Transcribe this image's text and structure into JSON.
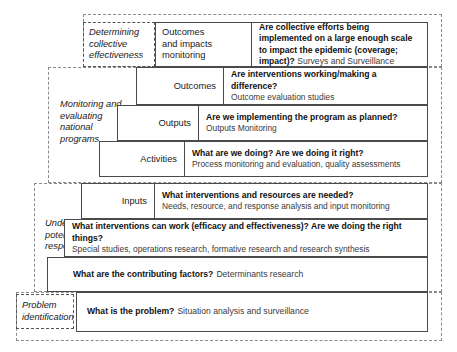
{
  "diagram": {
    "title_present": false,
    "phases": [
      {
        "id": "determining-collective-effectiveness",
        "label": "Determining\ncollective\neffectiveness",
        "boxed": true
      },
      {
        "id": "monitoring-and-evaluating-national-programs",
        "label": "Monitoring and\nevaluating\nnational\nprograms",
        "boxed": false
      },
      {
        "id": "understanding-potential-responses",
        "label": "Understanding\npotential\nresponses",
        "boxed": false
      },
      {
        "id": "problem-identification",
        "label": "Problem\nidentification",
        "boxed": true
      }
    ],
    "steps": [
      {
        "id": "outcomes-and-impacts-monitoring",
        "level": "Outcomes\nand impacts\nmonitoring",
        "question": "Are collective efforts being implemented on a large enough scale to impact the epidemic (coverage; impact)?",
        "method": "Surveys and Surveillance",
        "inline": true
      },
      {
        "id": "outcomes",
        "level": "Outcomes",
        "question": "Are interventions working/making a difference?",
        "method": "Outcome evaluation studies",
        "inline": false
      },
      {
        "id": "outputs",
        "level": "Outputs",
        "question": "Are we implementing the program as planned?",
        "method": "Outputs Monitoring",
        "inline": false
      },
      {
        "id": "activities",
        "level": "Activities",
        "question": "What are we doing? Are we doing it right?",
        "method": "Process monitoring and evaluation, quality assessments",
        "inline": false
      },
      {
        "id": "inputs",
        "level": "Inputs",
        "question": "What interventions and resources are needed?",
        "method": "Needs, resource, and response analysis and input monitoring",
        "inline": false
      },
      {
        "id": "interventions-efficacy",
        "level": "",
        "question": "What interventions can work (efficacy and effectiveness)? Are we doing the right things?",
        "method": "Special studies, operations research, formative research and research synthesis",
        "inline": false
      },
      {
        "id": "contributing-factors",
        "level": "",
        "question": "What are the contributing factors?",
        "method": "Determinants  research",
        "inline": true
      },
      {
        "id": "problem",
        "level": "",
        "question": "What is the problem?",
        "method": "Situation analysis and surveillance",
        "inline": true
      }
    ],
    "colors": {
      "box_border": "#4a4a4a",
      "dashed_border": "#8a8a8a",
      "question_text": "#111111",
      "method_text": "#3a3a3a",
      "background": "#ffffff"
    }
  }
}
